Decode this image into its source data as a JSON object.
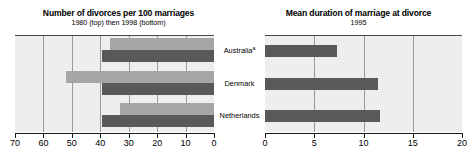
{
  "left_panel": {
    "title": "Number of divorces per 100 marriages",
    "subtitle": "1980 (top) then 1998 (bottom)"
  },
  "right_panel": {
    "title": "Mean duration of marriage at divorce",
    "subtitle": "1995"
  },
  "categories": [
    {
      "label": "Australia",
      "footnote": "a"
    },
    {
      "label": "Denmark",
      "footnote": ""
    },
    {
      "label": "Netherlands",
      "footnote": ""
    }
  ],
  "colors": {
    "bar_1980": "#a6a6a6",
    "bar_1998": "#595959",
    "bar_1995": "#595959",
    "panel_background": "#eeeeee",
    "gridline": "#9a9a9a",
    "axis": "#1a1a1a"
  },
  "chart_data": [
    {
      "type": "bar",
      "title": "Number of divorces per 100 marriages",
      "subtitle": "1980 (top) then 1998 (bottom)",
      "orientation": "horizontal",
      "categories": [
        "Australia",
        "Denmark",
        "Netherlands"
      ],
      "series": [
        {
          "name": "1980",
          "values": [
            36.5,
            52.0,
            33.0
          ],
          "color": "#a6a6a6"
        },
        {
          "name": "1998",
          "values": [
            39.5,
            39.5,
            39.5
          ],
          "color": "#595959"
        }
      ],
      "xlabel": "",
      "ylabel": "",
      "xlim": [
        70,
        0
      ],
      "x_reversed": true,
      "xticks": [
        70,
        60,
        50,
        40,
        30,
        20,
        10,
        0
      ],
      "xticklabels": [
        "70",
        "60",
        "50",
        "40",
        "30",
        "20",
        "10",
        "0"
      ],
      "grid": true,
      "legend": "none",
      "annotations": [
        "a"
      ]
    },
    {
      "type": "bar",
      "title": "Mean duration of marriage at divorce",
      "subtitle": "1995",
      "orientation": "horizontal",
      "categories": [
        "Australia",
        "Denmark",
        "Netherlands"
      ],
      "series": [
        {
          "name": "1995",
          "values": [
            7.3,
            11.5,
            11.7
          ],
          "color": "#595959"
        }
      ],
      "xlabel": "",
      "ylabel": "",
      "xlim": [
        0,
        20
      ],
      "x_reversed": false,
      "xticks": [
        0,
        5,
        10,
        15,
        20
      ],
      "xticklabels": [
        "0",
        "5",
        "10",
        "15",
        "20"
      ],
      "grid": true,
      "legend": "none",
      "annotations": []
    }
  ]
}
